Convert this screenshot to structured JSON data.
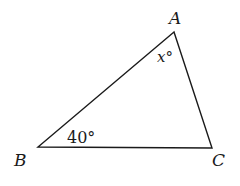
{
  "diagram": {
    "type": "triangle",
    "vertices": {
      "A": {
        "label": "A",
        "x": 174,
        "y": 32
      },
      "B": {
        "label": "B",
        "x": 38,
        "y": 147
      },
      "C": {
        "label": "C",
        "x": 212,
        "y": 148
      }
    },
    "angles": {
      "A": {
        "label": "x°"
      },
      "B": {
        "label": "40°"
      }
    },
    "colors": {
      "stroke": "#1a1a1a",
      "background": "#ffffff"
    }
  }
}
